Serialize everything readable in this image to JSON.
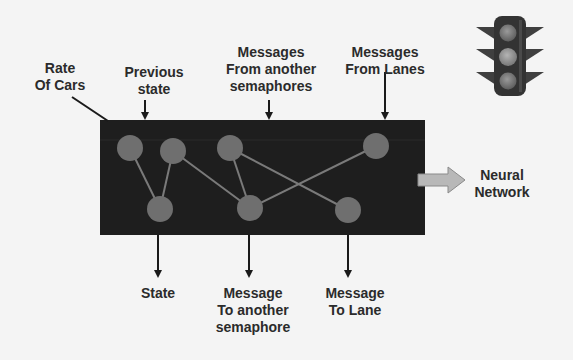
{
  "diagram": {
    "colors": {
      "background": "#f4f4f4",
      "box_fill": "#1e1e1e",
      "node_fill": "#6f6f6f",
      "edge_stroke": "#7a7a7a",
      "label_text": "#2b2b2b",
      "output_arrow_fill": "#b8b8b8"
    },
    "inputs": [
      {
        "id": "rate-of-cars",
        "lines": [
          "Rate",
          "Of Cars"
        ]
      },
      {
        "id": "previous-state",
        "lines": [
          "Previous",
          "state"
        ]
      },
      {
        "id": "messages-from-semaphores",
        "lines": [
          "Messages",
          "From another",
          "semaphores"
        ]
      },
      {
        "id": "messages-from-lanes",
        "lines": [
          "Messages",
          "From Lanes"
        ]
      }
    ],
    "outputs": [
      {
        "id": "state",
        "lines": [
          "State"
        ]
      },
      {
        "id": "message-to-semaphore",
        "lines": [
          "Message",
          "To another",
          "semaphore"
        ]
      },
      {
        "id": "message-to-lane",
        "lines": [
          "Message",
          "To Lane"
        ]
      }
    ],
    "side_output": {
      "id": "neural-network",
      "lines": [
        "Neural",
        "Network"
      ]
    },
    "nodes": {
      "top": [
        {
          "id": "t1",
          "x": 130,
          "y": 148
        },
        {
          "id": "t2",
          "x": 173,
          "y": 151
        },
        {
          "id": "t3",
          "x": 230,
          "y": 148
        },
        {
          "id": "t4",
          "x": 376,
          "y": 146
        }
      ],
      "bottom": [
        {
          "id": "b1",
          "x": 160,
          "y": 209
        },
        {
          "id": "b2",
          "x": 250,
          "y": 208
        },
        {
          "id": "b3",
          "x": 348,
          "y": 210
        }
      ]
    },
    "edges": [
      [
        "t1",
        "b1"
      ],
      [
        "t2",
        "b1"
      ],
      [
        "t2",
        "b2"
      ],
      [
        "t3",
        "b2"
      ],
      [
        "t3",
        "b3"
      ],
      [
        "t4",
        "b2"
      ]
    ],
    "icon": "traffic-light-icon"
  }
}
